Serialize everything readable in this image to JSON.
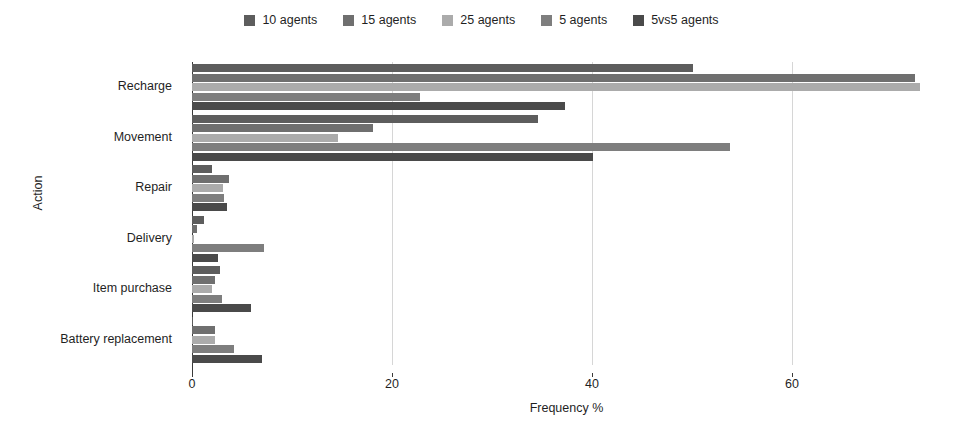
{
  "chart_data": {
    "type": "bar",
    "orientation": "horizontal",
    "title": "",
    "xlabel": "Frequency %",
    "ylabel": "Action",
    "categories": [
      "Recharge",
      "Movement",
      "Repair",
      "Delivery",
      "Item purchase",
      "Battery replacement"
    ],
    "xlim": [
      0,
      72.1
    ],
    "xticks": [
      0,
      20,
      40,
      60
    ],
    "xticklabels": [
      "0",
      "20",
      "40",
      "60"
    ],
    "grid": "vertical-only",
    "legend_position": "top-center",
    "series": [
      {
        "name": "10 agents",
        "color": "#5d5d5d",
        "values": [
          50.1,
          34.6,
          2.0,
          1.2,
          2.8,
          0.1
        ]
      },
      {
        "name": "15 agents",
        "color": "#6f6f6f",
        "values": [
          72.3,
          18.1,
          3.7,
          0.5,
          2.3,
          2.3
        ]
      },
      {
        "name": "25 agents",
        "color": "#ababab",
        "values": [
          72.8,
          14.6,
          3.1,
          0.2,
          2.0,
          2.3
        ]
      },
      {
        "name": "5 agents",
        "color": "#7e7e7e",
        "values": [
          22.8,
          53.8,
          3.2,
          7.2,
          3.0,
          4.2
        ]
      },
      {
        "name": "5vs5 agents",
        "color": "#4a4a4a",
        "values": [
          37.3,
          40.1,
          3.5,
          2.6,
          5.9,
          7.0
        ]
      }
    ]
  },
  "legend": {
    "items": [
      {
        "label": "10 agents",
        "color": "#5d5d5d"
      },
      {
        "label": "15 agents",
        "color": "#6f6f6f"
      },
      {
        "label": "25 agents",
        "color": "#ababab"
      },
      {
        "label": "5 agents",
        "color": "#7e7e7e"
      },
      {
        "label": "5vs5 agents",
        "color": "#4a4a4a"
      }
    ]
  },
  "axes": {
    "x": {
      "label": "Frequency %",
      "ticks": [
        "0",
        "20",
        "40",
        "60"
      ]
    },
    "y": {
      "label": "Action",
      "ticks": [
        "Recharge",
        "Movement",
        "Repair",
        "Delivery",
        "Item purchase",
        "Battery replacement"
      ]
    }
  }
}
